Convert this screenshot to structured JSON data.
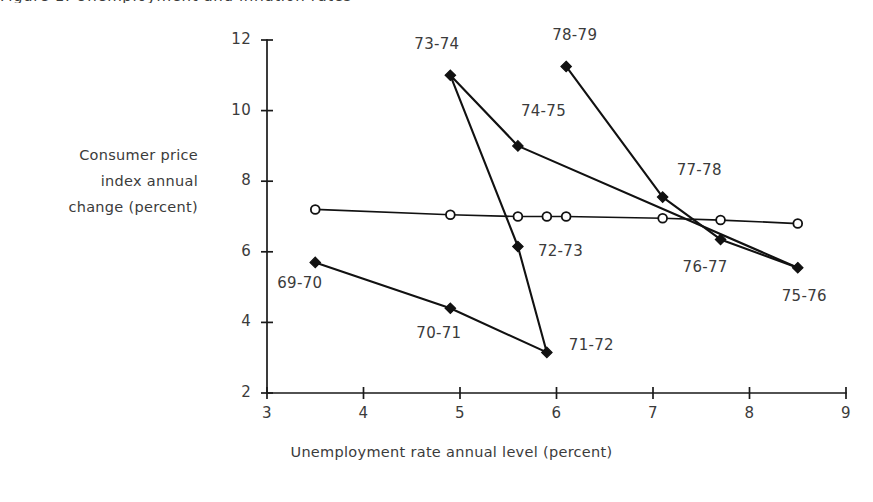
{
  "figure": {
    "title_partial": "Figure 1.   Unemployment and inflation rates"
  },
  "chart_data": {
    "type": "line",
    "title": "",
    "xlabel": "Unemployment rate annual level (percent)",
    "ylabel_lines": [
      "Consumer price",
      "index annual",
      "change (percent)"
    ],
    "ylabel": "Consumer price index annual change (percent)",
    "xlim": [
      3,
      9
    ],
    "ylim": [
      2,
      12
    ],
    "xticks": [
      3,
      4,
      5,
      6,
      7,
      8,
      9
    ],
    "xtick_labels": [
      "3",
      "4",
      "5",
      "6",
      "7",
      "8",
      "9"
    ],
    "yticks": [
      2,
      4,
      6,
      8,
      10,
      12
    ],
    "ytick_labels": [
      "2",
      "4",
      "6",
      "8",
      "10",
      "12"
    ],
    "grid": false,
    "legend": "none",
    "series": [
      {
        "name": "Actual annual observations",
        "marker": "filled-diamond",
        "points": [
          {
            "label": "69-70",
            "x": 3.5,
            "y": 5.7,
            "label_dx": -38,
            "label_dy": 22
          },
          {
            "label": "70-71",
            "x": 4.9,
            "y": 4.4,
            "label_dx": -34,
            "label_dy": 26
          },
          {
            "label": "71-72",
            "x": 5.9,
            "y": 3.15,
            "label_dx": 22,
            "label_dy": -6
          },
          {
            "label": "72-73",
            "x": 5.6,
            "y": 6.15,
            "label_dx": 20,
            "label_dy": 5
          },
          {
            "label": "73-74",
            "x": 4.9,
            "y": 11.0,
            "label_dx": -36,
            "label_dy": -30
          },
          {
            "label": "74-75",
            "x": 5.6,
            "y": 9.0,
            "label_dx": 3,
            "label_dy": -34
          },
          {
            "label": "75-76",
            "x": 8.5,
            "y": 5.55,
            "label_dx": -16,
            "label_dy": 29
          },
          {
            "label": "76-77",
            "x": 7.7,
            "y": 6.35,
            "label_dx": -38,
            "label_dy": 29
          },
          {
            "label": "77-78",
            "x": 7.1,
            "y": 7.55,
            "label_dx": 14,
            "label_dy": -26
          },
          {
            "label": "78-79",
            "x": 6.1,
            "y": 11.25,
            "label_dx": -14,
            "label_dy": -30
          }
        ],
        "path_order": [
          "69-70",
          "70-71",
          "71-72",
          "72-73",
          "73-74",
          "74-75",
          "75-76"
        ],
        "extra_path": [
          "78-79",
          "77-78",
          "76-77",
          "75-76"
        ]
      },
      {
        "name": "Fitted trend",
        "marker": "open-circle",
        "points": [
          {
            "x": 3.5,
            "y": 7.2
          },
          {
            "x": 4.9,
            "y": 7.05
          },
          {
            "x": 5.6,
            "y": 7.0
          },
          {
            "x": 5.9,
            "y": 7.0
          },
          {
            "x": 6.1,
            "y": 7.0
          },
          {
            "x": 7.1,
            "y": 6.95
          },
          {
            "x": 7.7,
            "y": 6.9
          },
          {
            "x": 8.5,
            "y": 6.8
          }
        ]
      }
    ]
  }
}
